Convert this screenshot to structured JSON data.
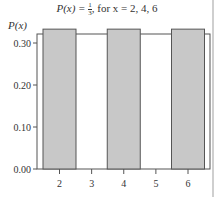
{
  "chart_data": {
    "type": "bar",
    "title_parts": {
      "lhs": "P(x) = ",
      "num": "1",
      "den": "3",
      "rhs": ", for x = 2, 4, 6"
    },
    "xlabel": "",
    "ylabel": "P(x)",
    "categories": [
      "2",
      "4",
      "6"
    ],
    "x": [
      2,
      4,
      6
    ],
    "values": [
      0.333,
      0.333,
      0.333
    ],
    "xticks": [
      "2",
      "3",
      "4",
      "5",
      "6"
    ],
    "yticks": [
      "0.00",
      "0.10",
      "0.20",
      "0.30"
    ],
    "ylim": [
      0,
      0.36
    ],
    "xlim": [
      1.5,
      6.5
    ],
    "grid": false,
    "legend": null,
    "bar_color": "#c8c8c8",
    "bar_edge_color": "#555555"
  }
}
